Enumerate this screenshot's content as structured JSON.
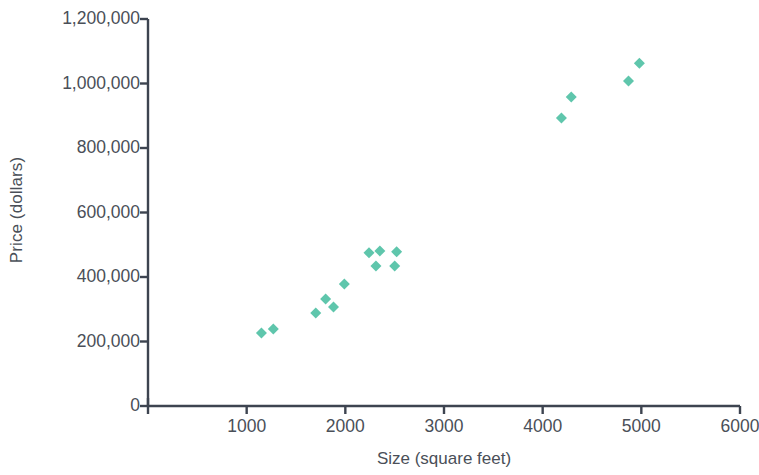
{
  "chart_data": {
    "type": "scatter",
    "title": "",
    "xlabel": "Size (square feet)",
    "ylabel": "Price (dollars)",
    "xlim": [
      0,
      6000
    ],
    "ylim": [
      0,
      1200000
    ],
    "grid": false,
    "legend": null,
    "marker": {
      "shape": "diamond",
      "color": "#5fc6ac",
      "size_px": 11
    },
    "x_ticks": [
      {
        "value": 1000,
        "label": "1000"
      },
      {
        "value": 2000,
        "label": "2000"
      },
      {
        "value": 3000,
        "label": "3000"
      },
      {
        "value": 4000,
        "label": "4000"
      },
      {
        "value": 5000,
        "label": "5000"
      },
      {
        "value": 6000,
        "label": "6000"
      }
    ],
    "y_ticks": [
      {
        "value": 0,
        "label": "0"
      },
      {
        "value": 200000,
        "label": "200,000"
      },
      {
        "value": 400000,
        "label": "400,000"
      },
      {
        "value": 600000,
        "label": "600,000"
      },
      {
        "value": 800000,
        "label": "800,000"
      },
      {
        "value": 1000000,
        "label": "1,000,000"
      },
      {
        "value": 1200000,
        "label": "1,200,000"
      }
    ],
    "series": [
      {
        "name": "Homes",
        "points": [
          {
            "x": 1150,
            "y": 226000
          },
          {
            "x": 1270,
            "y": 239000
          },
          {
            "x": 1700,
            "y": 288000
          },
          {
            "x": 1800,
            "y": 332000
          },
          {
            "x": 1880,
            "y": 307000
          },
          {
            "x": 1990,
            "y": 378000
          },
          {
            "x": 2240,
            "y": 475000
          },
          {
            "x": 2310,
            "y": 434000
          },
          {
            "x": 2350,
            "y": 481000
          },
          {
            "x": 2500,
            "y": 434000
          },
          {
            "x": 2520,
            "y": 478000
          },
          {
            "x": 4190,
            "y": 893000
          },
          {
            "x": 4290,
            "y": 958000
          },
          {
            "x": 4870,
            "y": 1008000
          },
          {
            "x": 4980,
            "y": 1063000
          }
        ]
      }
    ],
    "axis_color": "#3d4450"
  }
}
